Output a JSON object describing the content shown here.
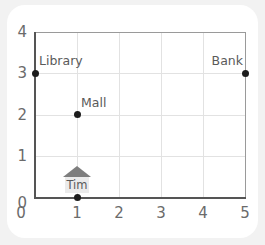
{
  "chart_data": {
    "type": "scatter",
    "title": "",
    "xlabel": "",
    "ylabel": "",
    "xlim": [
      0,
      5
    ],
    "ylim": [
      0,
      4
    ],
    "xticks": [
      "0",
      "1",
      "2",
      "3",
      "4",
      "5"
    ],
    "yticks": [
      "0",
      "1",
      "2",
      "3",
      "4"
    ],
    "grid": true,
    "legend": "none",
    "points": [
      {
        "label": "Library",
        "x": 0,
        "y": 3,
        "label_pos": "above-right",
        "marker": "dot"
      },
      {
        "label": "Bank",
        "x": 5,
        "y": 3,
        "label_pos": "above-left",
        "marker": "dot"
      },
      {
        "label": "Mall",
        "x": 1,
        "y": 2,
        "label_pos": "above-right",
        "marker": "dot"
      },
      {
        "label": "Tim",
        "x": 1,
        "y": 0,
        "label_pos": "above",
        "marker": "house"
      }
    ]
  },
  "colors": {
    "background": "#f2f2f2",
    "card": "#ffffff",
    "axis": "#555555",
    "grid": "#e2e2e2",
    "frame": "#9a9a9a",
    "point": "#1c1c1c",
    "label_text": "#5a5a5a",
    "tick_text": "#6b6b6b",
    "house_roof": "#7e7e7e",
    "house_body": "#ebebeb"
  }
}
